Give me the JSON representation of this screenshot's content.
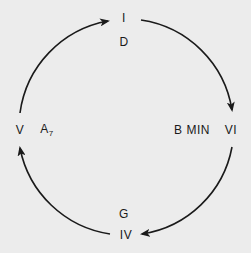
{
  "diagram": {
    "title": "",
    "background": "#ececec",
    "ink": "#1a1a1a",
    "nodes": [
      {
        "id": "I",
        "numeral": "I",
        "chord": "D",
        "chord_sub": ""
      },
      {
        "id": "VI",
        "numeral": "VI",
        "chord": "B MIN",
        "chord_sub": ""
      },
      {
        "id": "IV",
        "numeral": "IV",
        "chord": "G",
        "chord_sub": ""
      },
      {
        "id": "V",
        "numeral": "V",
        "chord": "A",
        "chord_sub": "7"
      }
    ],
    "edges": [
      {
        "from": "I",
        "to": "VI",
        "direction": "clockwise"
      },
      {
        "from": "VI",
        "to": "IV",
        "direction": "clockwise"
      },
      {
        "from": "IV",
        "to": "V",
        "direction": "clockwise"
      },
      {
        "from": "V",
        "to": "I",
        "direction": "clockwise"
      }
    ]
  }
}
